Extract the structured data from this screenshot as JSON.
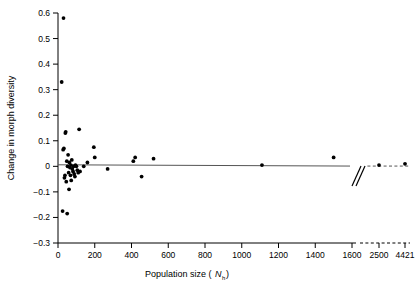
{
  "chart_data": {
    "type": "scatter",
    "title": "",
    "xlabel": "Population size (N h )",
    "xlabel_main": "Population size (",
    "xlabel_symbol": "N",
    "xlabel_sub": "h",
    "xlabel_close": " )",
    "ylabel": "Change in morph diversity",
    "xlim": [
      -60,
      1650
    ],
    "ylim": [
      -0.3,
      0.6
    ],
    "grid": false,
    "legend": null,
    "xticks": [
      0,
      200,
      400,
      600,
      800,
      1000,
      1200,
      1400,
      1600,
      2500,
      4421
    ],
    "xtick_labels": [
      "0",
      "200",
      "400",
      "600",
      "800",
      "1000",
      "1200",
      "1400",
      "1600",
      "2500",
      "4421"
    ],
    "yticks": [
      -0.3,
      -0.2,
      -0.1,
      0,
      0.1,
      0.2,
      0.3,
      0.4,
      0.5,
      0.6
    ],
    "ytick_labels": [
      "-0.3",
      "-0.2",
      "-0.1",
      "0",
      "0.1",
      "0.2",
      "0.3",
      "0.4",
      "0.5",
      "0.6"
    ],
    "axis_break": {
      "present": true,
      "symbol": "//",
      "after_value": 1600,
      "broken_ticks": [
        2500,
        4421
      ],
      "style": "dashed"
    },
    "regression_line": {
      "y_at_xmin": 0.006,
      "y_at_xmax": 0.001,
      "style": "solid",
      "continues_dashed_after_break": true
    },
    "x": [
      20,
      25,
      28,
      30,
      32,
      35,
      38,
      40,
      42,
      45,
      48,
      50,
      52,
      55,
      58,
      60,
      62,
      65,
      68,
      70,
      72,
      75,
      78,
      82,
      85,
      88,
      92,
      95,
      100,
      105,
      110,
      115,
      120,
      140,
      160,
      195,
      200,
      270,
      410,
      420,
      455,
      520,
      1110,
      1500
    ],
    "y": [
      0.33,
      -0.175,
      0.065,
      0.58,
      0.07,
      -0.045,
      -0.035,
      0.13,
      0.135,
      -0.06,
      0.02,
      -0.185,
      0.0,
      0.045,
      -0.025,
      -0.09,
      0.015,
      -0.005,
      -0.035,
      0.005,
      -0.055,
      0.025,
      -0.01,
      -0.02,
      0.0,
      -0.03,
      -0.04,
      0.005,
      0.0,
      -0.015,
      -0.025,
      0.145,
      -0.02,
      0.0,
      0.015,
      0.075,
      0.035,
      -0.01,
      0.02,
      0.035,
      -0.04,
      0.03,
      0.005,
      0.035
    ],
    "x_broken": [
      2500,
      4421
    ],
    "y_broken": [
      0.005,
      0.01
    ],
    "marker": "filled-circle",
    "marker_color": "#000000",
    "marker_size": 3.4
  },
  "figure": {
    "background": "#ffffff",
    "axis_color": "#000000",
    "line_color": "#000000"
  }
}
